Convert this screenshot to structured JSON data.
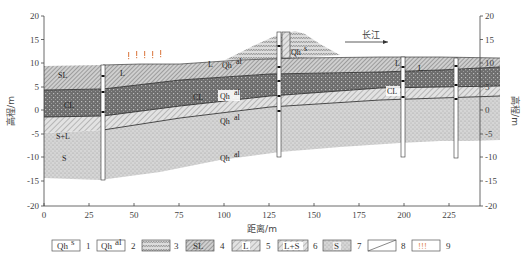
{
  "figure": {
    "type": "geological-cross-section",
    "x_axis": {
      "title": "距离/m",
      "ticks": [
        "0",
        "25",
        "50",
        "75",
        "100",
        "125",
        "150",
        "175",
        "200",
        "225"
      ],
      "range": [
        0,
        240
      ]
    },
    "y_axis_left": {
      "title": "高程/m",
      "ticks": [
        "20",
        "15",
        "10",
        "5",
        "0",
        "-5",
        "-10",
        "-15",
        "-20"
      ],
      "range": [
        -20,
        20
      ]
    },
    "y_axis_right": {
      "title": "高程/m",
      "ticks": [
        "20",
        "15",
        "10",
        "5",
        "0",
        "-5",
        "-10",
        "-15",
        "-20"
      ]
    },
    "annotations": {
      "river_label": "长江",
      "river_arrow": "right"
    },
    "layer_labels": {
      "sl_left": "SL",
      "cl_left": "CL",
      "sl2_left": "SL",
      "sl_upper_mid": "L",
      "qh_upper": "Qh",
      "qh_upper_sup": "al",
      "cl_mid": "CL",
      "qh_mid": "Qh",
      "qh_mid_sup": "al",
      "qh_lower": "Qh",
      "qh_lower_sup": "al",
      "qh_sand": "Qh",
      "qh_sand_sup": "al",
      "s_plus_l": "S+L",
      "s": "S",
      "qh_fill": "Qh",
      "qh_fill_sup": "s",
      "l_right1": "L",
      "l_right2": "L",
      "cl_right": "CL"
    },
    "boreholes_x_m": [
      33,
      131,
      201,
      229
    ],
    "colors": {
      "fill_layer": "#d8d8d8",
      "silty_clay": "#7a7a7a",
      "clay_dark": "#5a5a5a",
      "loam_hatch": "#cfcfcf",
      "sand": "#c9c9c9",
      "seepage_marks": "#e08a5a",
      "axis": "#444444"
    }
  },
  "legend": {
    "items": [
      {
        "num": "1",
        "label": "Qh",
        "sup": "s",
        "kind": "box-text"
      },
      {
        "num": "2",
        "label": "Qh",
        "sup": "al",
        "kind": "box-text"
      },
      {
        "num": "3",
        "label": "",
        "kind": "fill-pattern"
      },
      {
        "num": "4",
        "label": "SL",
        "kind": "dark-hatch"
      },
      {
        "num": "5",
        "label": "L",
        "kind": "hatch"
      },
      {
        "num": "6",
        "label": "L+S",
        "kind": "hatch"
      },
      {
        "num": "7",
        "label": "S",
        "kind": "sand"
      },
      {
        "num": "8",
        "label": "",
        "kind": "boundary-line"
      },
      {
        "num": "9",
        "label": "!!!",
        "kind": "seepage"
      }
    ]
  }
}
